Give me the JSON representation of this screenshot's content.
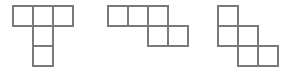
{
  "canvas": {
    "width": 290,
    "height": 71,
    "background_color": "#ffffff",
    "stroke_color": "#7a7a7a",
    "stroke_width": 1.6,
    "cell_size": 20
  },
  "figures": [
    {
      "name": "shape-1",
      "label": "T-pentomino",
      "origin_x": 13,
      "origin_y": 6,
      "cols": 3,
      "rows": 3,
      "cells": [
        {
          "col": 0,
          "row": 0
        },
        {
          "col": 1,
          "row": 0
        },
        {
          "col": 2,
          "row": 0
        },
        {
          "col": 1,
          "row": 1
        },
        {
          "col": 1,
          "row": 2
        }
      ]
    },
    {
      "name": "shape-2",
      "label": "N-pentomino",
      "origin_x": 108,
      "origin_y": 6,
      "cols": 4,
      "rows": 2,
      "cells": [
        {
          "col": 0,
          "row": 0
        },
        {
          "col": 1,
          "row": 0
        },
        {
          "col": 2,
          "row": 0
        },
        {
          "col": 2,
          "row": 1
        },
        {
          "col": 3,
          "row": 1
        }
      ]
    },
    {
      "name": "shape-3",
      "label": "W-pentomino",
      "origin_x": 218,
      "origin_y": 6,
      "cols": 3,
      "rows": 3,
      "cells": [
        {
          "col": 0,
          "row": 0
        },
        {
          "col": 0,
          "row": 1
        },
        {
          "col": 1,
          "row": 1
        },
        {
          "col": 1,
          "row": 2
        },
        {
          "col": 2,
          "row": 2
        }
      ]
    }
  ]
}
